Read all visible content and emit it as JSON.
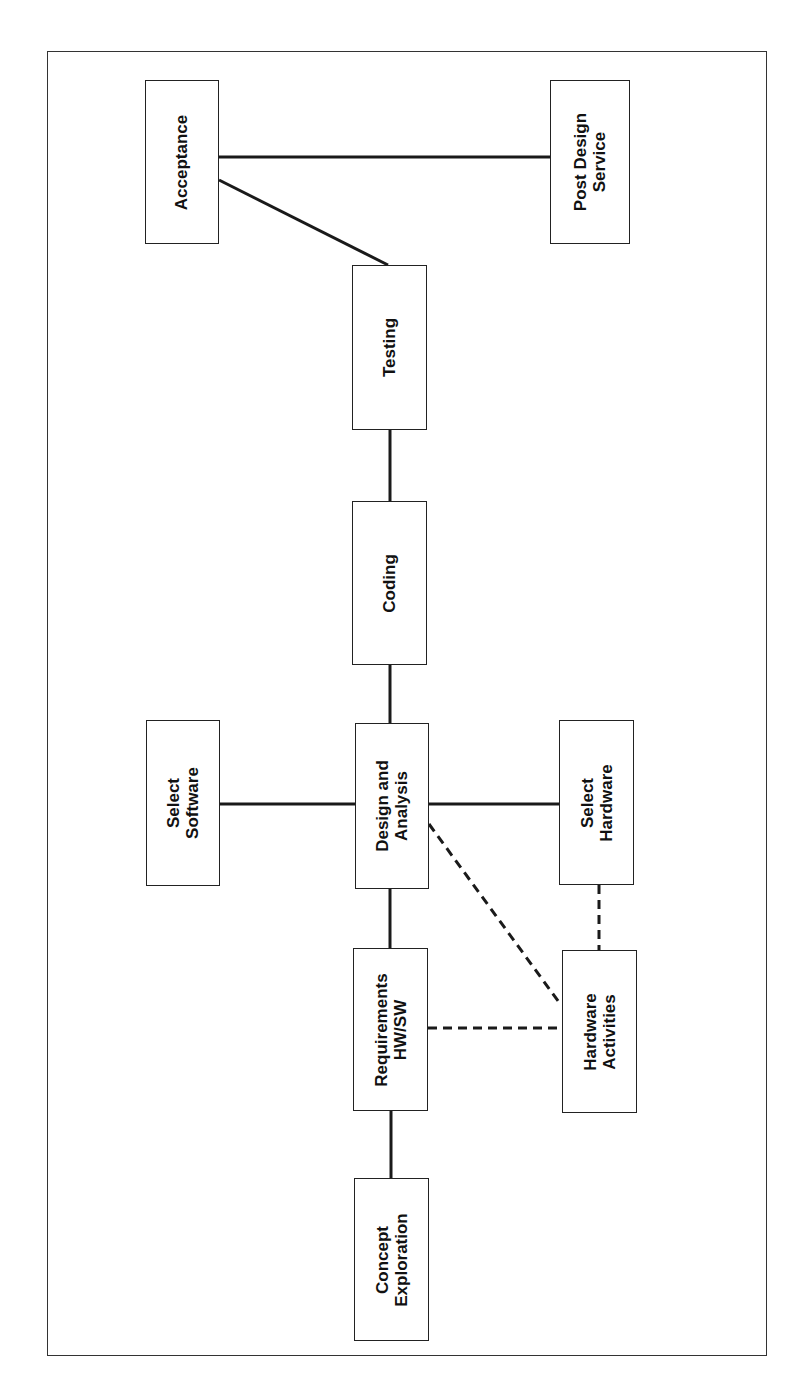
{
  "diagram": {
    "type": "process-flow",
    "orientation": "rotated-90",
    "colors": {
      "line": "#1a1a1a",
      "box_border": "#222222",
      "background": "#ffffff"
    },
    "nodes": [
      {
        "id": "acceptance",
        "label": "Acceptance",
        "x": 145,
        "y": 80,
        "w": 74,
        "h": 164
      },
      {
        "id": "post-design-service",
        "label": "Post Design\nService",
        "x": 550,
        "y": 80,
        "w": 80,
        "h": 164
      },
      {
        "id": "testing",
        "label": "Testing",
        "x": 352,
        "y": 265,
        "w": 75,
        "h": 165
      },
      {
        "id": "coding",
        "label": "Coding",
        "x": 352,
        "y": 501,
        "w": 75,
        "h": 164
      },
      {
        "id": "select-software",
        "label": "Select\nSoftware",
        "x": 146,
        "y": 720,
        "w": 74,
        "h": 166
      },
      {
        "id": "design-and-analysis",
        "label": "Design and\nAnalysis",
        "x": 355,
        "y": 723,
        "w": 74,
        "h": 166
      },
      {
        "id": "select-hardware",
        "label": "Select\nHardware",
        "x": 559,
        "y": 720,
        "w": 75,
        "h": 165
      },
      {
        "id": "requirements-hw-sw",
        "label": "Requirements\nHW/SW",
        "x": 353,
        "y": 948,
        "w": 75,
        "h": 163
      },
      {
        "id": "hardware-activities",
        "label": "Hardware\nActivities",
        "x": 562,
        "y": 950,
        "w": 75,
        "h": 163
      },
      {
        "id": "concept-exploration",
        "label": "Concept\nExploration",
        "x": 354,
        "y": 1178,
        "w": 75,
        "h": 163
      }
    ],
    "edges": [
      {
        "from": "acceptance",
        "to": "post-design-service",
        "style": "solid",
        "x1": 219,
        "y1": 157,
        "x2": 550,
        "y2": 157
      },
      {
        "from": "acceptance",
        "to": "testing",
        "style": "solid",
        "x1": 219,
        "y1": 180,
        "x2": 388,
        "y2": 265
      },
      {
        "from": "testing",
        "to": "coding",
        "style": "solid",
        "x1": 390,
        "y1": 430,
        "x2": 390,
        "y2": 501
      },
      {
        "from": "coding",
        "to": "design-and-analysis",
        "style": "solid",
        "x1": 390,
        "y1": 665,
        "x2": 390,
        "y2": 723
      },
      {
        "from": "select-software",
        "to": "design-and-analysis",
        "style": "solid",
        "x1": 220,
        "y1": 804,
        "x2": 355,
        "y2": 804
      },
      {
        "from": "design-and-analysis",
        "to": "select-hardware",
        "style": "solid",
        "x1": 429,
        "y1": 804,
        "x2": 559,
        "y2": 804
      },
      {
        "from": "design-and-analysis",
        "to": "requirements-hw-sw",
        "style": "solid",
        "x1": 390,
        "y1": 889,
        "x2": 390,
        "y2": 948
      },
      {
        "from": "requirements-hw-sw",
        "to": "concept-exploration",
        "style": "solid",
        "x1": 391,
        "y1": 1111,
        "x2": 391,
        "y2": 1178
      },
      {
        "from": "design-and-analysis",
        "to": "hardware-activities",
        "style": "dashed",
        "x1": 429,
        "y1": 824,
        "x2": 561,
        "y2": 1005
      },
      {
        "from": "select-hardware",
        "to": "hardware-activities",
        "style": "dashed",
        "x1": 599,
        "y1": 885,
        "x2": 599,
        "y2": 950
      },
      {
        "from": "requirements-hw-sw",
        "to": "hardware-activities",
        "style": "dashed",
        "x1": 428,
        "y1": 1028,
        "x2": 562,
        "y2": 1028
      }
    ]
  }
}
